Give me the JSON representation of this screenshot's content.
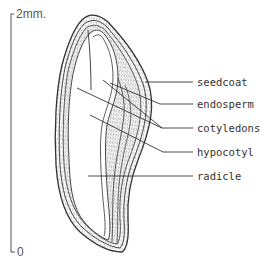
{
  "diagram": {
    "scale_bar": {
      "top_label": "2mm.",
      "bottom_label": "0"
    },
    "labels": [
      {
        "id": "seedcoat",
        "text": "seedcoat"
      },
      {
        "id": "endosperm",
        "text": "endosperm"
      },
      {
        "id": "cotyledons",
        "text": "cotyledons"
      },
      {
        "id": "hypocotyl",
        "text": "hypocotyl"
      },
      {
        "id": "radicle",
        "text": "radicle"
      }
    ],
    "colors": {
      "ink": "#333333",
      "background": "#ffffff",
      "stipple": "#777777"
    }
  }
}
